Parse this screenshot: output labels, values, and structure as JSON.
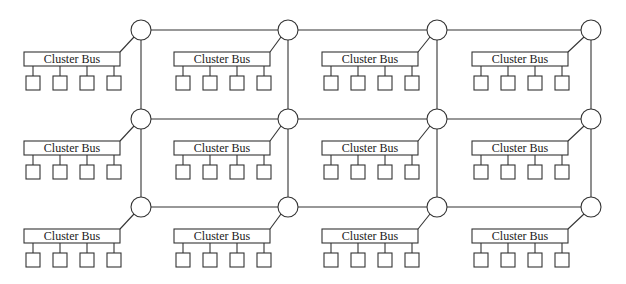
{
  "diagram": {
    "title": "",
    "bus_label": "Cluster Bus",
    "grid": {
      "rows": 3,
      "cols": 4
    },
    "node_x": [
      141,
      288,
      437,
      591
    ],
    "node_y": [
      30,
      119,
      207
    ],
    "node_radius": 10,
    "bus_left": [
      24,
      174,
      322,
      472
    ],
    "bus_top": [
      52,
      141,
      229
    ],
    "bus_width": 96,
    "bus_height": 14,
    "processors_per_cluster": 4,
    "clusters": [
      {
        "row": 0,
        "col": 0,
        "label": "Cluster Bus"
      },
      {
        "row": 0,
        "col": 1,
        "label": "Cluster Bus"
      },
      {
        "row": 0,
        "col": 2,
        "label": "Cluster Bus"
      },
      {
        "row": 0,
        "col": 3,
        "label": "Cluster Bus"
      },
      {
        "row": 1,
        "col": 0,
        "label": "Cluster Bus"
      },
      {
        "row": 1,
        "col": 1,
        "label": "Cluster Bus"
      },
      {
        "row": 1,
        "col": 2,
        "label": "Cluster Bus"
      },
      {
        "row": 1,
        "col": 3,
        "label": "Cluster Bus"
      },
      {
        "row": 2,
        "col": 0,
        "label": "Cluster Bus"
      },
      {
        "row": 2,
        "col": 1,
        "label": "Cluster Bus"
      },
      {
        "row": 2,
        "col": 2,
        "label": "Cluster Bus"
      },
      {
        "row": 2,
        "col": 3,
        "label": "Cluster Bus"
      }
    ],
    "colors": {
      "line": "#333333",
      "background": "#ffffff",
      "text": "#222222"
    }
  }
}
